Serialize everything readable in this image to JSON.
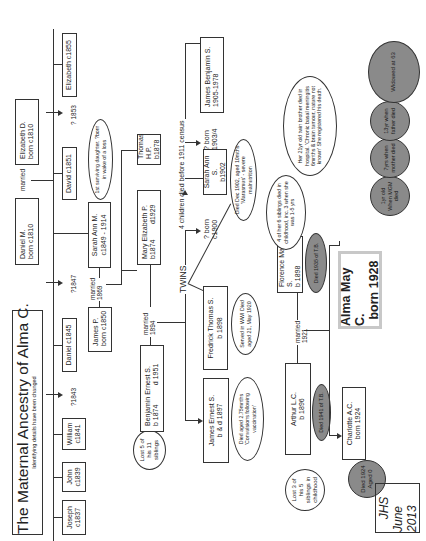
{
  "title": {
    "main": "The Maternal Ancestry of Alma C.",
    "subtitle": "Identifying details have been changed"
  },
  "generation1": {
    "father": {
      "name": "Daniel M.",
      "dates": "born c1810"
    },
    "mother": {
      "name": "Elizabeth D.",
      "dates": "born c1810"
    },
    "marriage_label": "married"
  },
  "generation1_children": [
    {
      "name": "Joseph",
      "dates": "c1837"
    },
    {
      "name": "John",
      "dates": "c1839"
    },
    {
      "name": "William",
      "dates": "c1841"
    },
    {
      "unknown": "?1843"
    },
    {
      "name": "Daniel c1845"
    },
    {
      "unknown": "?1847"
    },
    {
      "name": "Sarah Ann M.",
      "dates": "c1849 - 1914"
    },
    {
      "name": "David c1851"
    },
    {
      "unknown": "? 1853"
    },
    {
      "name": "Elizabeth c1855"
    }
  ],
  "notes": {
    "sarah_ann_m": "1st surviving daughter. ?born in wake of a loss",
    "benjamin": "Lost 5 of his 11 siblings",
    "sarah_ann_s": "Died Dec 1902, aged 10mths 'Marasmus' - severe malnutrition",
    "james_ernest": "Died aged 2.75mnths 'Convulsions following vaccination'",
    "fredrick": "Served in WWI Died aged 21, May 1920",
    "florence_siblings": "4 of her 6 siblings died in childhood, inc. 3 when she was 1-5 yrs",
    "florence_twin": "Her 21yr old twin brother died in hospital. 'Chronic basal meningitis 6mnths & brain tumour, nature not known' She registered his death.",
    "arthur": "Lost 3 of his 5 siblings in childhood",
    "florence_death": "Died 1935 of T.B.",
    "arthur_death": "Died 1941 of T.B.",
    "charlotte_death": "Died 1924 Aged 0"
  },
  "generation2": {
    "husband": {
      "name": "James P.",
      "dates": "born c1850"
    },
    "wife": {
      "name": "Sarah Ann M.",
      "dates": "c1849 - 1914"
    },
    "marriage_label": "married",
    "marriage_year": "1869",
    "children": [
      {
        "name": "Mary Elizabeth P.",
        "born": "b1874",
        "died": "d1929"
      },
      {
        "name": "Thomas H.P.",
        "dates": "b1878"
      }
    ]
  },
  "generation3": {
    "husband": {
      "name": "Benjamin Ernest S.",
      "born": "b 1874",
      "died": "d 1951"
    },
    "marriage_label": "married",
    "marriage_year": "1894",
    "twins_label": "TWINS",
    "children_died_label": "4 children died before 1911 census",
    "children": [
      {
        "name": "James Ernest S.",
        "dates": "b & d 1897"
      },
      {
        "name": "Fredrick Thomas S.",
        "dates": "b 1898"
      },
      {
        "name": "Florence May S.",
        "dates": "b 1898"
      },
      {
        "unknown": "? born",
        "dates": "c1900"
      },
      {
        "name": "Sarah Ann S.",
        "dates": "b1902"
      },
      {
        "unknown": "? born",
        "dates": "1903/4"
      },
      {
        "name": "James Benjamin S.",
        "dates": "1905-1978"
      }
    ]
  },
  "generation4": {
    "husband": {
      "name": "Arthur L.C.",
      "dates": "b 1896"
    },
    "marriage_label": "married",
    "marriage_year": "1921",
    "children": [
      {
        "name": "Charlotte A.C.",
        "dates": "born 1924"
      },
      {
        "name": "Alma May C.",
        "dates": "born 1928"
      }
    ]
  },
  "alma_milestones": [
    "1yr old When MGM died",
    "7yrs when mother died",
    "13yr when father died",
    "Widowed at 63"
  ],
  "signature": {
    "initials": "JHS",
    "date": "June 2013"
  }
}
